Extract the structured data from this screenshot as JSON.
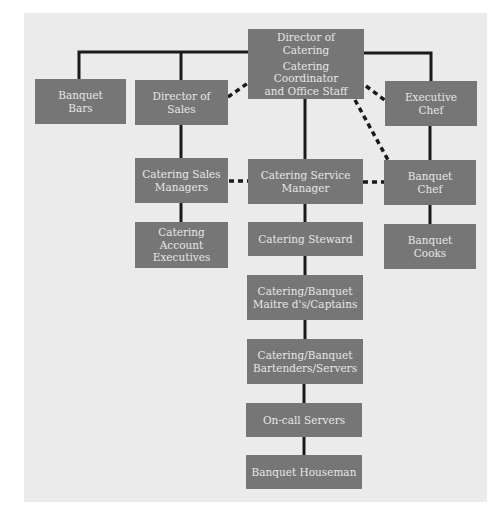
{
  "diagram": {
    "type": "organization-chart",
    "colors": {
      "background": "#ebebeb",
      "box_fill": "#767676",
      "box_text": "#e6e6e6",
      "connector": "#1a1a1a"
    },
    "nodes": {
      "director_catering": {
        "line1": "Director of",
        "line2": "Catering",
        "line3": "Catering Coordinator",
        "line4": "and Office Staff"
      },
      "banquet_bars": {
        "line1": "Banquet",
        "line2": "Bars"
      },
      "director_sales": {
        "line1": "Director of",
        "line2": "Sales"
      },
      "executive_chef": {
        "line1": "Executive",
        "line2": "Chef"
      },
      "catering_sales_managers": {
        "line1": "Catering Sales",
        "line2": "Managers"
      },
      "catering_service_manager": {
        "line1": "Catering Service",
        "line2": "Manager"
      },
      "banquet_chef": {
        "line1": "Banquet",
        "line2": "Chef"
      },
      "catering_account_executives": {
        "line1": "Catering",
        "line2": "Account",
        "line3": "Executives"
      },
      "catering_steward": {
        "line1": "Catering Steward"
      },
      "banquet_cooks": {
        "line1": "Banquet",
        "line2": "Cooks"
      },
      "maitre_d": {
        "line1": "Catering/Banquet",
        "line2": "Maitre d's/Captains"
      },
      "bartenders_servers": {
        "line1": "Catering/Banquet",
        "line2": "Bartenders/Servers"
      },
      "on_call_servers": {
        "line1": "On-call Servers"
      },
      "banquet_houseman": {
        "line1": "Banquet Houseman"
      }
    },
    "edges": [
      {
        "from": "Director of Catering",
        "to": "Banquet Bars",
        "style": "solid"
      },
      {
        "from": "Director of Catering",
        "to": "Director of Sales",
        "style": "solid"
      },
      {
        "from": "Director of Catering",
        "to": "Director of Sales",
        "style": "dashed"
      },
      {
        "from": "Director of Catering",
        "to": "Executive Chef",
        "style": "solid"
      },
      {
        "from": "Director of Catering",
        "to": "Executive Chef",
        "style": "dashed"
      },
      {
        "from": "Director of Catering",
        "to": "Banquet Chef",
        "style": "dashed"
      },
      {
        "from": "Director of Catering",
        "to": "Catering Service Manager",
        "style": "solid"
      },
      {
        "from": "Director of Sales",
        "to": "Catering Sales Managers",
        "style": "solid"
      },
      {
        "from": "Catering Sales Managers",
        "to": "Catering Service Manager",
        "style": "dashed"
      },
      {
        "from": "Catering Service Manager",
        "to": "Banquet Chef",
        "style": "dashed"
      },
      {
        "from": "Executive Chef",
        "to": "Banquet Chef",
        "style": "solid"
      },
      {
        "from": "Catering Sales Managers",
        "to": "Catering Account Executives",
        "style": "solid"
      },
      {
        "from": "Catering Service Manager",
        "to": "Catering Steward",
        "style": "solid"
      },
      {
        "from": "Banquet Chef",
        "to": "Banquet Cooks",
        "style": "solid"
      },
      {
        "from": "Catering Steward",
        "to": "Catering/Banquet Maitre d's/Captains",
        "style": "solid"
      },
      {
        "from": "Catering/Banquet Maitre d's/Captains",
        "to": "Catering/Banquet Bartenders/Servers",
        "style": "solid"
      },
      {
        "from": "Catering/Banquet Bartenders/Servers",
        "to": "On-call Servers",
        "style": "solid"
      },
      {
        "from": "On-call Servers",
        "to": "Banquet Houseman",
        "style": "solid"
      }
    ]
  }
}
